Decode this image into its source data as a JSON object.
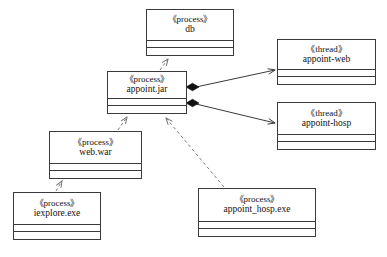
{
  "diagram": {
    "caption": "",
    "stroke_color": "#3a3a3a",
    "fill_color": "#ffffff",
    "text_color": "#111111",
    "nodes": [
      {
        "id": "db",
        "stereotype": "《process》",
        "name": "db",
        "x": 146,
        "y": 9,
        "width": 88,
        "height": 47
      },
      {
        "id": "appoint-jar",
        "stereotype": "《process》",
        "name": "appoint.jar",
        "x": 107,
        "y": 71,
        "width": 80,
        "height": 43
      },
      {
        "id": "appoint-web",
        "stereotype": "《thread》",
        "name": "appoint-web",
        "x": 277,
        "y": 39,
        "width": 99,
        "height": 46
      },
      {
        "id": "appoint-hosp",
        "stereotype": "《thread》",
        "name": "appoint-hosp",
        "x": 277,
        "y": 102,
        "width": 99,
        "height": 48
      },
      {
        "id": "web-war",
        "stereotype": "《process》",
        "name": "web.war",
        "x": 49,
        "y": 131,
        "width": 93,
        "height": 48
      },
      {
        "id": "iexplore-exe",
        "stereotype": "《process》",
        "name": "iexplore.exe",
        "x": 13,
        "y": 192,
        "width": 88,
        "height": 48
      },
      {
        "id": "appoint-hosp-exe",
        "stereotype": "《process》",
        "name": "appoint_hosp.exe",
        "x": 198,
        "y": 188,
        "width": 118,
        "height": 49
      }
    ],
    "edges": [
      {
        "id": "edge-appointjar-db",
        "from": "appoint-jar",
        "to": "db",
        "type": "dependency",
        "style": "dashed",
        "arrow": "open"
      },
      {
        "id": "edge-appointjar-appointweb",
        "from": "appoint-jar",
        "to": "appoint-web",
        "type": "composition",
        "style": "solid",
        "arrow": "open",
        "source_decoration": "filled-diamond"
      },
      {
        "id": "edge-appointjar-appointhosp",
        "from": "appoint-jar",
        "to": "appoint-hosp",
        "type": "composition",
        "style": "solid",
        "arrow": "open",
        "source_decoration": "filled-diamond"
      },
      {
        "id": "edge-webwar-appointjar",
        "from": "web-war",
        "to": "appoint-jar",
        "type": "dependency",
        "style": "dashed",
        "arrow": "open"
      },
      {
        "id": "edge-iexplore-webwar",
        "from": "iexplore-exe",
        "to": "web-war",
        "type": "dependency",
        "style": "dashed",
        "arrow": "open"
      },
      {
        "id": "edge-appointhospexe-appointjar",
        "from": "appoint-hosp-exe",
        "to": "appoint-jar",
        "type": "dependency",
        "style": "dashed",
        "arrow": "open"
      }
    ]
  }
}
